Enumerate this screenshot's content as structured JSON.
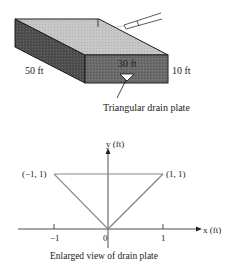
{
  "tank": {
    "length_label": "50 ft",
    "width_label": "30 ft",
    "depth_label": "10 ft",
    "plate_label": "Triangular drain plate"
  },
  "plate_view": {
    "y_axis_label": "y (ft)",
    "x_axis_label": "x (ft)",
    "point_left": "(−1, 1)",
    "point_right": "(1, 1)",
    "tick_neg1": "−1",
    "tick_0": "0",
    "tick_1": "1",
    "caption": "Enlarged view of drain plate"
  },
  "colors": {
    "top_face": "#c9c9c9",
    "front_face": "#6e6e6e",
    "side_face": "#555555",
    "outline": "#1a1a1a",
    "triangle_line": "#8a8a8a"
  }
}
